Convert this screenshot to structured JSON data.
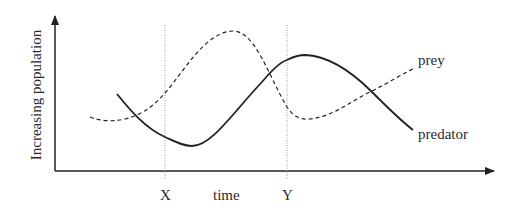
{
  "diagram": {
    "type": "line",
    "y_axis_label": "Increasing population",
    "x_axis_label": "time",
    "markers": [
      {
        "label": "X",
        "x": 165
      },
      {
        "label": "Y",
        "x": 287
      }
    ],
    "series": [
      {
        "name": "prey",
        "style": "dashed",
        "label": "prey"
      },
      {
        "name": "predator",
        "style": "solid",
        "label": "predator"
      }
    ],
    "colors": {
      "line": "#222222",
      "marker_line": "#888888",
      "background": "#ffffff"
    }
  }
}
